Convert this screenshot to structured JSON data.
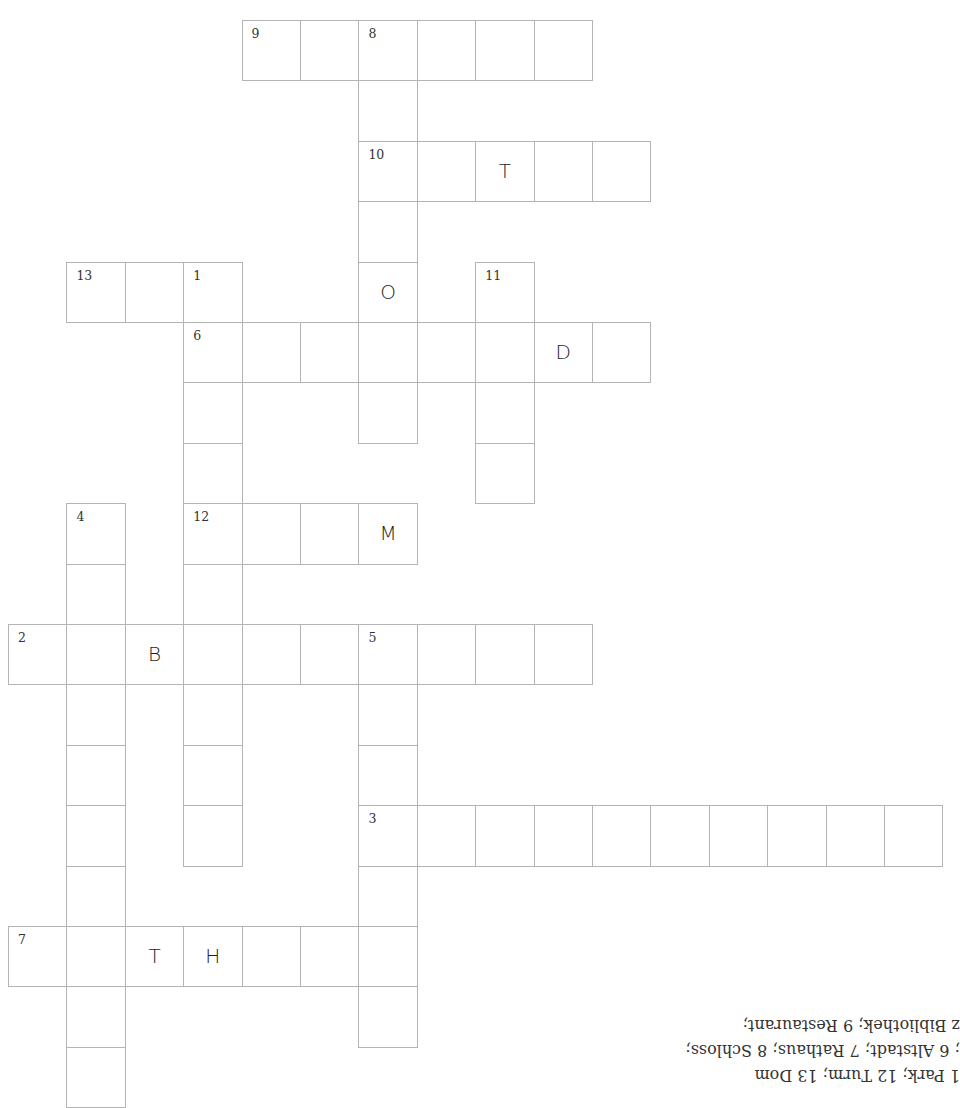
{
  "puzzle": {
    "type": "crossword",
    "cell_width": 58.4,
    "cell_height": 60.4,
    "origin_x": 8,
    "origin_y": 20,
    "colors": {
      "border": "#b4b4b4",
      "number": "#333333",
      "letter": "#1e1e1e"
    },
    "cells": [
      {
        "r": 0,
        "c": 4,
        "num": "9"
      },
      {
        "r": 0,
        "c": 5
      },
      {
        "r": 0,
        "c": 6,
        "num": "8"
      },
      {
        "r": 0,
        "c": 7
      },
      {
        "r": 0,
        "c": 8
      },
      {
        "r": 0,
        "c": 9
      },
      {
        "r": 1,
        "c": 6
      },
      {
        "r": 2,
        "c": 6,
        "num": "10"
      },
      {
        "r": 2,
        "c": 7
      },
      {
        "r": 2,
        "c": 8,
        "letter": "T"
      },
      {
        "r": 2,
        "c": 9
      },
      {
        "r": 2,
        "c": 10
      },
      {
        "r": 3,
        "c": 6
      },
      {
        "r": 4,
        "c": 1,
        "num": "13"
      },
      {
        "r": 4,
        "c": 2
      },
      {
        "r": 4,
        "c": 3,
        "num": "1"
      },
      {
        "r": 4,
        "c": 6,
        "letter": "O"
      },
      {
        "r": 4,
        "c": 8,
        "num": "11"
      },
      {
        "r": 5,
        "c": 3,
        "num": "6"
      },
      {
        "r": 5,
        "c": 4
      },
      {
        "r": 5,
        "c": 5
      },
      {
        "r": 5,
        "c": 6
      },
      {
        "r": 5,
        "c": 7
      },
      {
        "r": 5,
        "c": 8
      },
      {
        "r": 5,
        "c": 9,
        "letter": "D"
      },
      {
        "r": 5,
        "c": 10
      },
      {
        "r": 6,
        "c": 3
      },
      {
        "r": 6,
        "c": 6
      },
      {
        "r": 6,
        "c": 8
      },
      {
        "r": 7,
        "c": 3
      },
      {
        "r": 7,
        "c": 8
      },
      {
        "r": 8,
        "c": 1,
        "num": "4"
      },
      {
        "r": 8,
        "c": 3,
        "num": "12"
      },
      {
        "r": 8,
        "c": 4
      },
      {
        "r": 8,
        "c": 5
      },
      {
        "r": 8,
        "c": 6,
        "letter": "M"
      },
      {
        "r": 9,
        "c": 1
      },
      {
        "r": 9,
        "c": 3
      },
      {
        "r": 10,
        "c": 0,
        "num": "2"
      },
      {
        "r": 10,
        "c": 1
      },
      {
        "r": 10,
        "c": 2,
        "letter": "B"
      },
      {
        "r": 10,
        "c": 3
      },
      {
        "r": 10,
        "c": 4
      },
      {
        "r": 10,
        "c": 5
      },
      {
        "r": 10,
        "c": 6,
        "num": "5"
      },
      {
        "r": 10,
        "c": 7
      },
      {
        "r": 10,
        "c": 8
      },
      {
        "r": 10,
        "c": 9
      },
      {
        "r": 11,
        "c": 1
      },
      {
        "r": 11,
        "c": 3
      },
      {
        "r": 11,
        "c": 6
      },
      {
        "r": 12,
        "c": 1
      },
      {
        "r": 12,
        "c": 3
      },
      {
        "r": 12,
        "c": 6
      },
      {
        "r": 13,
        "c": 1
      },
      {
        "r": 13,
        "c": 3
      },
      {
        "r": 13,
        "c": 6,
        "num": "3"
      },
      {
        "r": 13,
        "c": 7
      },
      {
        "r": 13,
        "c": 8
      },
      {
        "r": 13,
        "c": 9
      },
      {
        "r": 13,
        "c": 10
      },
      {
        "r": 13,
        "c": 11
      },
      {
        "r": 13,
        "c": 12
      },
      {
        "r": 13,
        "c": 13
      },
      {
        "r": 13,
        "c": 14
      },
      {
        "r": 13,
        "c": 15
      },
      {
        "r": 14,
        "c": 1
      },
      {
        "r": 14,
        "c": 6
      },
      {
        "r": 15,
        "c": 0,
        "num": "7"
      },
      {
        "r": 15,
        "c": 1
      },
      {
        "r": 15,
        "c": 2,
        "letter": "T"
      },
      {
        "r": 15,
        "c": 3,
        "letter": "H"
      },
      {
        "r": 15,
        "c": 4
      },
      {
        "r": 15,
        "c": 5
      },
      {
        "r": 15,
        "c": 6
      },
      {
        "r": 16,
        "c": 1
      },
      {
        "r": 16,
        "c": 6
      },
      {
        "r": 17,
        "c": 1
      }
    ]
  },
  "answer_key": {
    "orientation": "upside-down",
    "lines": [
      "z Bibliothek; 9 Restaurant;",
      "; 6 Altstadt; 7 Rathaus; 8 Schloss;",
      "1 Park; 12 Turm; 13 Dom"
    ]
  }
}
